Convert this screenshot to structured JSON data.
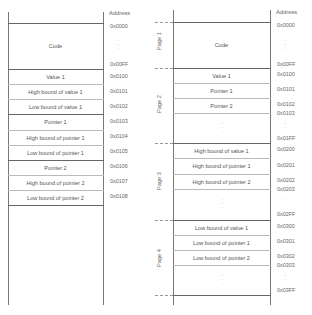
{
  "left_diagram": {
    "header": "Address",
    "code_label": "Code",
    "code_addr_start": "0x0000",
    "code_addr_end": "0x00FF",
    "rows": [
      {
        "label": "Value 1",
        "addr": "0x0100"
      },
      {
        "label": "High bound of value 1",
        "addr": "0x0101"
      },
      {
        "label": "Low bound of value 1",
        "addr": "0x0102"
      },
      {
        "label": "Pointer 1",
        "addr": "0x0103"
      },
      {
        "label": "High bound of pointer 1",
        "addr": "0x0104"
      },
      {
        "label": "Low bound of pointer 1",
        "addr": "0x0105"
      },
      {
        "label": "Pointer 2",
        "addr": "0x0106"
      },
      {
        "label": "High bound of pointer 2",
        "addr": "0x0107"
      },
      {
        "label": "Low bound of pointer 2",
        "addr": "0x0108"
      }
    ]
  },
  "right_diagram": {
    "header": "Address",
    "pages": [
      {
        "label": "Page 1"
      },
      {
        "label": "Page 2"
      },
      {
        "label": "Page 3"
      },
      {
        "label": "Page 4"
      }
    ],
    "code_label": "Code",
    "code_addr_start": "0x0000",
    "code_addr_end": "0x00FF",
    "page2_rows": [
      {
        "label": "Value 1",
        "addr": "0x0100"
      },
      {
        "label": "Pointer 1",
        "addr": "0x0101"
      },
      {
        "label": "Pointer 2",
        "addr": "0x0102"
      }
    ],
    "page2_next": "0x0103",
    "page2_end": "0x01FF",
    "page3_rows": [
      {
        "label": "High bound of value 1",
        "addr": "0x0200"
      },
      {
        "label": "High bound of pointer 1",
        "addr": "0x0201"
      },
      {
        "label": "High bound of pointer 2",
        "addr": "0x0202"
      }
    ],
    "page3_next": "0x0203",
    "page3_end": "0x02FF",
    "page4_rows": [
      {
        "label": "Low bound of value 1",
        "addr": "0x0300"
      },
      {
        "label": "Low bound of pointer 1",
        "addr": "0x0301"
      },
      {
        "label": "Low bound of pointer 2",
        "addr": "0x0302"
      }
    ],
    "page4_next": "0x0303",
    "page4_end": "0x03FF"
  },
  "symbols": {
    "vdots": "·\n·\n·"
  }
}
